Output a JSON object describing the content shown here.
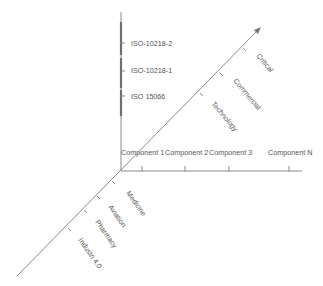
{
  "diagram": {
    "axes": {
      "vertical": {
        "label": "Standards",
        "color": "#7a7a7a"
      },
      "horizontal": {
        "label": "Components",
        "color": "#8a8a8a"
      },
      "diagonal": {
        "label": "Domains",
        "color": "#8a8a8a"
      }
    },
    "vertical_labels": [
      {
        "text": "ISO-10218-2"
      },
      {
        "text": "ISO-10218-1"
      },
      {
        "text": "ISO 15066"
      }
    ],
    "horizontal_labels": [
      {
        "text": "Component 1"
      },
      {
        "text": "Component 2"
      },
      {
        "text": "Component 3"
      },
      {
        "text": "Component N"
      }
    ],
    "upper_diagonal_labels": [
      {
        "text": "Critical"
      },
      {
        "text": "Commercial"
      },
      {
        "text": "Technology"
      }
    ],
    "lower_diagonal_labels": [
      {
        "text": "Medicine"
      },
      {
        "text": "Aviation"
      },
      {
        "text": "Pharmacy"
      },
      {
        "text": "Industri 4.0"
      }
    ]
  }
}
